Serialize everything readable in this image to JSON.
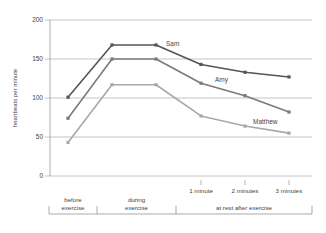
{
  "chart_data": {
    "type": "line",
    "title": "",
    "xlabel": "",
    "ylabel": "heartbeats per minute",
    "ylim": [
      0,
      200
    ],
    "yticks": [
      0,
      50,
      100,
      150,
      200
    ],
    "grid": true,
    "legend_position": "inline labels",
    "x": [
      "before exercise",
      "during exercise (start)",
      "during exercise (end)",
      "1 minute",
      "2 minutes",
      "3 minutes"
    ],
    "x_tick_labels": [
      "1 minute",
      "2 minutes",
      "3 minutes"
    ],
    "x_groups": [
      {
        "label_line1": "before",
        "label_line2": "exercise"
      },
      {
        "label_line1": "during",
        "label_line2": "exercise"
      },
      {
        "label_line1": "at rest after exercise",
        "label_line2": ""
      }
    ],
    "series": [
      {
        "name": "Sam",
        "color": "#555555",
        "values": [
          101,
          168,
          168,
          143,
          133,
          127
        ]
      },
      {
        "name": "Amy",
        "color": "#7a7a7a",
        "values": [
          74,
          150,
          150,
          119,
          103,
          82
        ]
      },
      {
        "name": "Matthew",
        "color": "#a8a8a8",
        "values": [
          43,
          117,
          117,
          77,
          64,
          55
        ]
      }
    ]
  }
}
